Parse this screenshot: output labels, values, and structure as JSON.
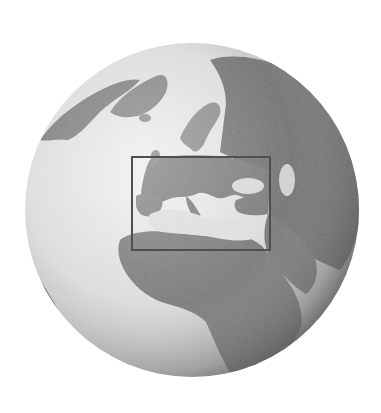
{
  "figure": {
    "type": "orthographic-globe",
    "view_center": "Mediterranean / Europe-Africa",
    "colors": {
      "background": "#ffffff",
      "ocean_light": "#e6e6e6",
      "ocean_shade": "#8a8a8a",
      "land": "#7a7a7a",
      "land_dark": "#5e5e5e",
      "ice": "#c4c4c4",
      "highlight_rect": "#4f4f4f"
    },
    "globe": {
      "cx": 192,
      "cy": 210,
      "r": 167
    },
    "highlight_region": {
      "label": "Europe / Mediterranean region",
      "x": 132,
      "y": 157,
      "width": 138,
      "height": 93,
      "stroke_width": 2
    },
    "regions": [
      "Greenland",
      "Europe",
      "Mediterranean Sea",
      "Black Sea",
      "Caspian Sea",
      "Africa",
      "Middle East",
      "Russia"
    ]
  }
}
